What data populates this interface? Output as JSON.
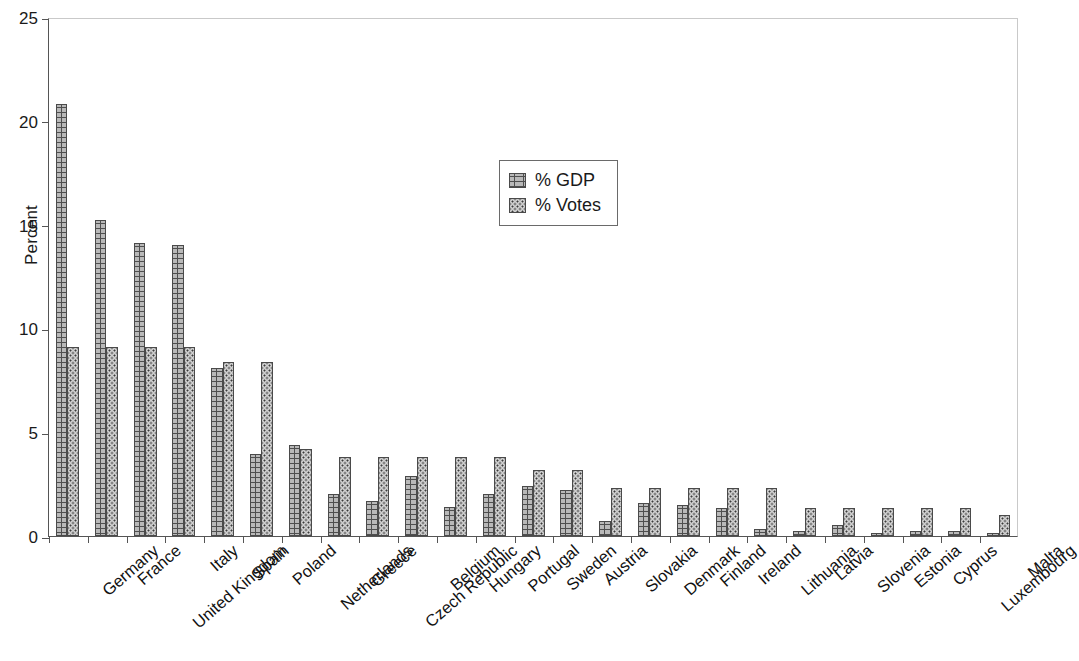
{
  "chart_data": {
    "type": "bar",
    "title": "",
    "xlabel": "",
    "ylabel": "Percent",
    "ylim": [
      0,
      25
    ],
    "yticks": [
      0,
      5,
      10,
      15,
      20,
      25
    ],
    "grid": false,
    "legend_position": "upper-center",
    "categories": [
      "Germany",
      "France",
      "United Kingdom",
      "Italy",
      "Spain",
      "Poland",
      "Netherlands",
      "Greece",
      "Czech Republic",
      "Belgium",
      "Hungary",
      "Portugal",
      "Sweden",
      "Austria",
      "Slovakia",
      "Denmark",
      "Finland",
      "Ireland",
      "Lithuania",
      "Latvia",
      "Slovenia",
      "Estonia",
      "Cyprus",
      "Luxembourg",
      "Malta"
    ],
    "series": [
      {
        "name": "% GDP",
        "values": [
          20.8,
          15.2,
          14.1,
          14.0,
          8.1,
          3.95,
          4.4,
          2.0,
          1.7,
          2.9,
          1.4,
          2.0,
          2.4,
          2.2,
          0.7,
          1.6,
          1.5,
          1.35,
          0.35,
          0.25,
          0.55,
          0.15,
          0.25,
          0.25,
          0.15
        ]
      },
      {
        "name": "% Votes",
        "values": [
          9.1,
          9.1,
          9.1,
          9.1,
          8.4,
          8.4,
          4.2,
          3.8,
          3.8,
          3.8,
          3.8,
          3.8,
          3.2,
          3.2,
          2.3,
          2.3,
          2.3,
          2.3,
          2.3,
          1.35,
          1.35,
          1.35,
          1.35,
          1.35,
          1.0
        ]
      }
    ]
  },
  "legend": {
    "items": [
      {
        "label": "% GDP",
        "swatch": "brick-pattern-swatch"
      },
      {
        "label": "% Votes",
        "swatch": "dotted-pattern-swatch"
      }
    ]
  },
  "axes": {
    "y_title": "Percent",
    "y_tick_labels": [
      "0",
      "5",
      "10",
      "15",
      "20",
      "25"
    ]
  }
}
